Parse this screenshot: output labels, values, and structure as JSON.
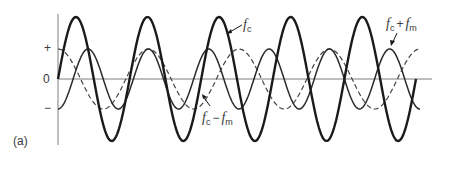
{
  "figure": {
    "panel_label": "(a)",
    "axis": {
      "plus_label": "+",
      "zero_label": "0",
      "minus_label": "−",
      "color": "#a8a8a8"
    },
    "waves": [
      {
        "name": "carrier",
        "label_main": "f",
        "label_sub": "c",
        "style": "solid-thick",
        "color": "#1a1a1a",
        "amplitude": 62,
        "period": 71.6,
        "phase": "sine",
        "x_start": 58,
        "x_end": 416
      },
      {
        "name": "upper-sideband",
        "label_main": "f",
        "label_sub": "c",
        "label_op": "+",
        "label_main2": "f",
        "label_sub2": "m",
        "style": "solid-thin",
        "color": "#2a2a2a",
        "amplitude": 30,
        "period": 60.3,
        "phase": "neg-cosine",
        "x_start": 58,
        "x_end": 420
      },
      {
        "name": "lower-sideband",
        "label_main": "f",
        "label_sub": "c",
        "label_op": "−",
        "label_main2": "f",
        "label_sub2": "m",
        "style": "dashed",
        "color": "#444444",
        "amplitude": 30,
        "period": 90.5,
        "phase": "cosine",
        "x_start": 58,
        "x_end": 420
      }
    ]
  }
}
